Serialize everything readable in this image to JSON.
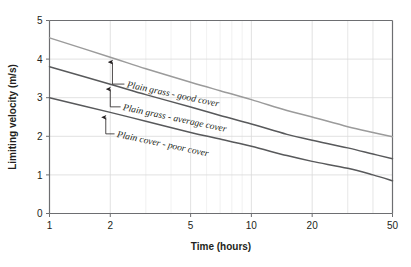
{
  "chart_data": {
    "type": "line",
    "title": "",
    "xlabel": "Time (hours)",
    "ylabel": "Limiting velocity (m/s)",
    "xscale": "log",
    "yscale": "linear",
    "xlim": [
      1,
      50
    ],
    "ylim": [
      0,
      5
    ],
    "xticks": [
      1,
      2,
      5,
      10,
      20,
      50
    ],
    "xticklabels": [
      "1",
      "2",
      "5",
      "10",
      "20",
      "50"
    ],
    "yticks": [
      0,
      1,
      2,
      3,
      4,
      5
    ],
    "yticklabels": [
      "0",
      "1",
      "2",
      "3",
      "4",
      "5"
    ],
    "grid": true,
    "grid_minor": true,
    "legend": "none",
    "x": [
      1,
      2,
      3,
      5,
      7,
      10,
      15,
      20,
      30,
      40,
      50
    ],
    "series": [
      {
        "name": "Plain grass - good cover",
        "color": "#9b9b9b",
        "values": [
          4.55,
          4.05,
          3.75,
          3.4,
          3.18,
          2.95,
          2.67,
          2.5,
          2.25,
          2.1,
          1.99
        ]
      },
      {
        "name": "Plain grass - average cover",
        "color": "#58595b",
        "values": [
          3.8,
          3.35,
          3.08,
          2.76,
          2.54,
          2.32,
          2.05,
          1.9,
          1.7,
          1.54,
          1.42
        ]
      },
      {
        "name": "Plain cover - poor cover",
        "color": "#58595b",
        "values": [
          3.0,
          2.62,
          2.39,
          2.1,
          1.93,
          1.74,
          1.5,
          1.35,
          1.17,
          1.0,
          0.85
        ]
      }
    ],
    "annotations": [
      {
        "label": "Plain grass - good cover",
        "target_x": 2.05,
        "target_y": 4.05,
        "text_x": 2.35,
        "text_y": 3.27
      },
      {
        "label": "Plain grass - average cover",
        "target_x": 2.0,
        "target_y": 3.35,
        "text_x": 2.25,
        "text_y": 2.68
      },
      {
        "label": "Plain cover - poor cover",
        "target_x": 1.9,
        "target_y": 2.62,
        "text_x": 2.1,
        "text_y": 1.98
      }
    ]
  },
  "colors": {
    "axis": "#6d6e71",
    "grid": "#d9d9d9",
    "grid_minor": "#e8e8e8",
    "text": "#231f20",
    "series_light": "#9b9b9b",
    "series_dark": "#58595b",
    "background": "#ffffff"
  },
  "labels": {
    "x_title": "Time (hours)",
    "y_title": "Limiting velocity (m/s)"
  }
}
